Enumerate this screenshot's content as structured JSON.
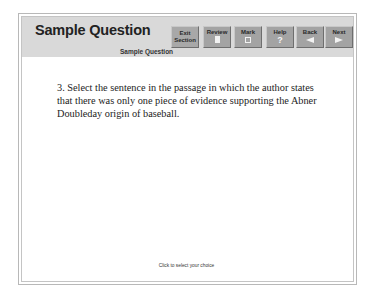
{
  "header": {
    "title": "Sample Question",
    "subtitle": "Sample Question",
    "buttons": {
      "exit_line1": "Exit",
      "exit_line2": "Section",
      "review": "Review",
      "mark": "Mark",
      "help": "Help",
      "help_glyph": "?",
      "back": "Back",
      "next": "Next"
    }
  },
  "main": {
    "question": "3. Select the sentence in the passage in which the author states that there was only one piece of evidence supporting the Abner Doubleday origin of baseball."
  },
  "footer": {
    "hint": "Click to select your choice"
  },
  "colors": {
    "header_bg": "#d9d9d9",
    "button_bg": "#a3a3a3"
  }
}
